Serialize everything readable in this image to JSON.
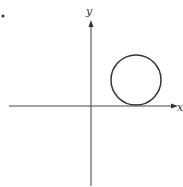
{
  "diagram": {
    "bullet": "•",
    "axes": {
      "x_label": "x",
      "y_label": "y",
      "origin": [
        91,
        106
      ]
    },
    "circle": {
      "center": [
        136,
        80
      ],
      "radius": 25,
      "tangent_to": "x-axis",
      "quadrant": "I"
    },
    "stroke_color": "#333333",
    "background": "#ffffff"
  }
}
